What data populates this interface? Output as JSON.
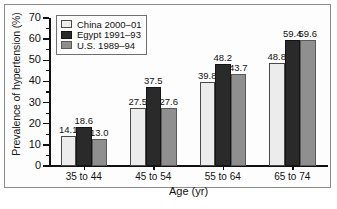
{
  "figure": {
    "ylabel": "Prevalence of hypertension (%)",
    "xlabel": "Age (yr)"
  },
  "legend": {
    "items": [
      {
        "label": "China 2000–01",
        "color": "#ececec"
      },
      {
        "label": "Egypt 1991–93",
        "color": "#2a2a2a"
      },
      {
        "label": "U.S. 1989–94",
        "color": "#8f8f8f"
      }
    ]
  },
  "yaxis": {
    "ticks": [
      "70",
      "60",
      "50",
      "40",
      "30",
      "20",
      "10",
      "0"
    ]
  },
  "xaxis": {
    "ticks": [
      "35 to 44",
      "45 to 54",
      "55 to 64",
      "65 to 74"
    ]
  },
  "values": {
    "g0": {
      "s0": "14.1",
      "s1": "18.6",
      "s2": "13.0"
    },
    "g1": {
      "s0": "27.5",
      "s1": "37.5",
      "s2": "27.6"
    },
    "g2": {
      "s0": "39.8",
      "s1": "48.2",
      "s2": "43.7"
    },
    "g3": {
      "s0": "48.8",
      "s1": "59.4",
      "s2": "59.6"
    }
  },
  "chart_data": {
    "type": "bar",
    "title": "",
    "xlabel": "Age (yr)",
    "ylabel": "Prevalence of hypertension (%)",
    "categories": [
      "35 to 44",
      "45 to 54",
      "55 to 64",
      "65 to 74"
    ],
    "series": [
      {
        "name": "China 2000–01",
        "color": "#ececec",
        "values": [
          14.1,
          27.5,
          39.8,
          48.8
        ]
      },
      {
        "name": "Egypt 1991–93",
        "color": "#2a2a2a",
        "values": [
          18.6,
          37.5,
          48.2,
          59.4
        ]
      },
      {
        "name": "U.S. 1989–94",
        "color": "#8f8f8f",
        "values": [
          13.0,
          27.6,
          43.7,
          59.6
        ]
      }
    ],
    "ylim": [
      0,
      70
    ],
    "ytick_step": 10,
    "ytick_minor_step": 5,
    "grid": false,
    "legend_position": "top-left",
    "data_labels": true
  }
}
